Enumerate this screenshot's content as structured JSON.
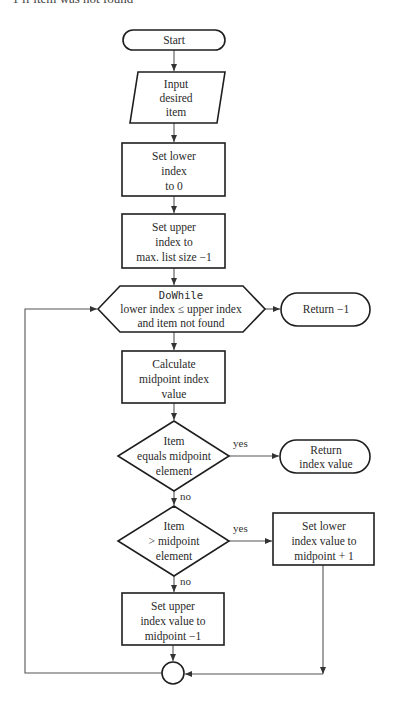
{
  "header": {
    "cutoff_caption": "-1 if item was not found"
  },
  "nodes": {
    "start": {
      "type": "terminal",
      "lines": [
        "Start"
      ]
    },
    "input": {
      "type": "input-output",
      "lines": [
        "Input",
        "desired",
        "item"
      ]
    },
    "set_lower": {
      "type": "process",
      "lines": [
        "Set lower",
        "index",
        "to 0"
      ]
    },
    "set_upper": {
      "type": "process",
      "lines": [
        "Set upper",
        "index to",
        "max. list size −1"
      ]
    },
    "loop": {
      "type": "loop-hexagon",
      "keyword": "DoWhile",
      "lines": [
        "lower index ≤ upper index",
        "and item not found"
      ]
    },
    "return_fail": {
      "type": "terminal",
      "lines": [
        "Return −1"
      ]
    },
    "calc_mid": {
      "type": "process",
      "lines": [
        "Calculate",
        "midpoint index",
        "value"
      ]
    },
    "decision_equal": {
      "type": "decision",
      "lines": [
        "Item",
        "equals midpoint",
        "element"
      ]
    },
    "return_found": {
      "type": "terminal",
      "lines": [
        "Return",
        "index value"
      ]
    },
    "decision_greater": {
      "type": "decision",
      "lines": [
        "Item",
        "> midpoint",
        "element"
      ]
    },
    "set_lower_mid": {
      "type": "process",
      "lines": [
        "Set lower",
        "index value to",
        "midpoint + 1"
      ]
    },
    "set_upper_mid": {
      "type": "process",
      "lines": [
        "Set upper",
        "index value to",
        "midpoint −1"
      ]
    },
    "junction": {
      "type": "connector",
      "lines": []
    }
  },
  "edges": [
    {
      "from": "start",
      "to": "input"
    },
    {
      "from": "input",
      "to": "set_lower"
    },
    {
      "from": "set_lower",
      "to": "set_upper"
    },
    {
      "from": "set_upper",
      "to": "loop"
    },
    {
      "from": "loop",
      "to": "return_fail",
      "label": ""
    },
    {
      "from": "loop",
      "to": "calc_mid"
    },
    {
      "from": "calc_mid",
      "to": "decision_equal"
    },
    {
      "from": "decision_equal",
      "to": "return_found",
      "label": "yes"
    },
    {
      "from": "decision_equal",
      "to": "decision_greater",
      "label": "no"
    },
    {
      "from": "decision_greater",
      "to": "set_lower_mid",
      "label": "yes"
    },
    {
      "from": "decision_greater",
      "to": "set_upper_mid",
      "label": "no"
    },
    {
      "from": "set_upper_mid",
      "to": "junction"
    },
    {
      "from": "set_lower_mid",
      "to": "junction"
    },
    {
      "from": "junction",
      "to": "loop"
    }
  ],
  "branch_labels": {
    "yes": "yes",
    "no": "no"
  },
  "colors": {
    "shape_stroke": "#1e1e1e",
    "connector_line": "#555555",
    "text": "#2a2a2a",
    "background": "#ffffff"
  }
}
